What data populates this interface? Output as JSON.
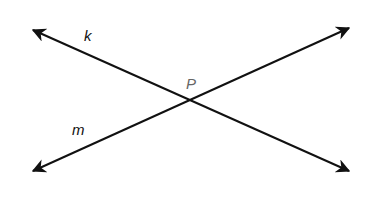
{
  "diagram": {
    "type": "intersecting-lines",
    "lines": [
      {
        "name": "k",
        "from": [
          31,
          29
        ],
        "to": [
          351,
          172
        ],
        "arrows": "both"
      },
      {
        "name": "m",
        "from": [
          31,
          172
        ],
        "to": [
          351,
          27
        ],
        "arrows": "both"
      }
    ],
    "intersection": {
      "label": "P",
      "point": [
        190,
        100
      ]
    },
    "labels": {
      "line_k": "k",
      "line_m": "m",
      "point_p": "P"
    },
    "colors": {
      "line": "#111111",
      "point_label": "#666666",
      "line_label": "#111111"
    }
  }
}
